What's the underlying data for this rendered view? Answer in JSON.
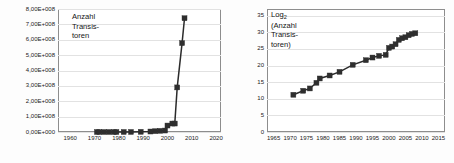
{
  "figure": {
    "title": "",
    "panel_count": 2
  },
  "chart_data": [
    {
      "id": "transistor-count-linear",
      "type": "line",
      "title": "",
      "annotation": "Anzahl Transis- toren",
      "annotation_lines": [
        "Anzahl",
        "Transis-",
        "toren"
      ],
      "xlabel": "",
      "ylabel": "",
      "grid": true,
      "legend": "none",
      "xlim": [
        1955,
        2022
      ],
      "ylim": [
        0,
        800000000
      ],
      "xticks": [
        1960,
        1970,
        1980,
        1990,
        2000,
        2010,
        2020
      ],
      "xticklabels": [
        "1960",
        "1970",
        "1980",
        "1990",
        "2000",
        "2010",
        "2020"
      ],
      "yticks": [
        0,
        100000000,
        200000000,
        300000000,
        400000000,
        500000000,
        600000000,
        700000000,
        800000000
      ],
      "yticklabels": [
        "0,00E+000",
        "1,00E+008",
        "2,00E+008",
        "3,00E+008",
        "4,00E+008",
        "5,00E+008",
        "6,00E+008",
        "7,00E+008",
        "8,00E+008"
      ],
      "x": [
        1971,
        1972,
        1974,
        1976,
        1978,
        1979,
        1982,
        1985,
        1989,
        1993,
        1995,
        1997,
        1999,
        2000,
        2002,
        2003,
        2004,
        2006,
        2007
      ],
      "y": [
        2300,
        3500,
        6000,
        8500,
        29000,
        68000,
        134000,
        275000,
        1180000,
        3100000,
        5500000,
        7500000,
        9500000,
        42000000,
        55000000,
        220000000,
        592000000,
        582000000,
        731000000
      ],
      "y_display": [
        2300,
        3500,
        6000,
        8500,
        29000,
        68000,
        134000,
        275000,
        1180000,
        3100000,
        5500000,
        7500000,
        9500000,
        42000000,
        55000000,
        55000000,
        290000000,
        578000000,
        740000000
      ],
      "marker": "square",
      "line_color": "#2b2b2b"
    },
    {
      "id": "transistor-count-log2",
      "type": "line",
      "title": "",
      "annotation": "Log2 (Anzahl Transis- toren)",
      "annotation_lines": [
        "Log",
        "(Anzahl",
        "Transis-",
        "toren)"
      ],
      "annotation_subscript": "2",
      "xlabel": "",
      "ylabel": "",
      "grid": true,
      "legend": "none",
      "xlim": [
        1963,
        2017
      ],
      "ylim": [
        0,
        37
      ],
      "xticks": [
        1965,
        1970,
        1975,
        1980,
        1985,
        1990,
        1995,
        2000,
        2005,
        2010,
        2015
      ],
      "xticklabels": [
        "1965",
        "1970",
        "1975",
        "1980",
        "1985",
        "1990",
        "1995",
        "2000",
        "2005",
        "2010",
        "2015"
      ],
      "yticks": [
        0,
        5,
        10,
        15,
        20,
        25,
        30,
        35
      ],
      "yticklabels": [
        "0",
        "5",
        "10",
        "15",
        "20",
        "25",
        "30",
        "35"
      ],
      "x": [
        1971,
        1974,
        1976,
        1978,
        1979,
        1982,
        1985,
        1989,
        1993,
        1995,
        1997,
        1999,
        2000,
        2001,
        2002,
        2003,
        2004,
        2005,
        2006,
        2007,
        2008
      ],
      "y": [
        11.2,
        12.4,
        13.1,
        14.8,
        16.1,
        17.0,
        18.1,
        20.2,
        21.6,
        22.4,
        22.9,
        23.2,
        25.3,
        25.7,
        26.4,
        27.7,
        28.2,
        28.5,
        29.1,
        29.5,
        29.7
      ],
      "marker": "square",
      "line_color": "#2b2b2b"
    }
  ]
}
